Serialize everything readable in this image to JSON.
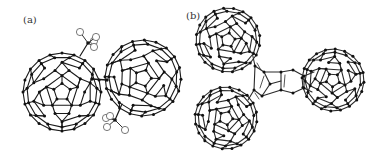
{
  "figure": {
    "panels": [
      {
        "label": "(a)",
        "description": "C60 dimer linked by a single bond, each cage bearing a substituent group with open-circle terminal atoms",
        "cages": [
          {
            "cx": 62,
            "cy": 92,
            "r": 39
          },
          {
            "cx": 143,
            "cy": 78,
            "r": 38
          }
        ],
        "link": {
          "x1": 92,
          "y1": 79,
          "x2": 107,
          "y2": 80
        },
        "substituents": [
          {
            "anchor": [
              80,
              56
            ],
            "center": [
              88,
              43
            ],
            "atoms": [
              [
                80,
                32
              ],
              [
                94,
                41
              ],
              [
                96,
                37
              ],
              [
                94,
                47
              ]
            ]
          },
          {
            "anchor": [
              122,
              104
            ],
            "center": [
              115,
              120
            ],
            "atoms": [
              [
                106,
                118
              ],
              [
                107,
                127
              ],
              [
                125,
                130
              ],
              [
                110,
                116
              ]
            ]
          }
        ],
        "colors": {
          "bond": "#1a1a1a",
          "atom": "#111111",
          "open_atom": "#555555"
        }
      },
      {
        "label": "(b)",
        "description": "C60 trimer: three cages connected through a central bridging ring unit",
        "cages": [
          {
            "cx": 228,
            "cy": 40,
            "r": 32
          },
          {
            "cx": 226,
            "cy": 118,
            "r": 31
          },
          {
            "cx": 333,
            "cy": 80,
            "r": 31
          }
        ],
        "colors": {
          "bond": "#2a2a2a",
          "atom": "#111111"
        }
      }
    ]
  }
}
